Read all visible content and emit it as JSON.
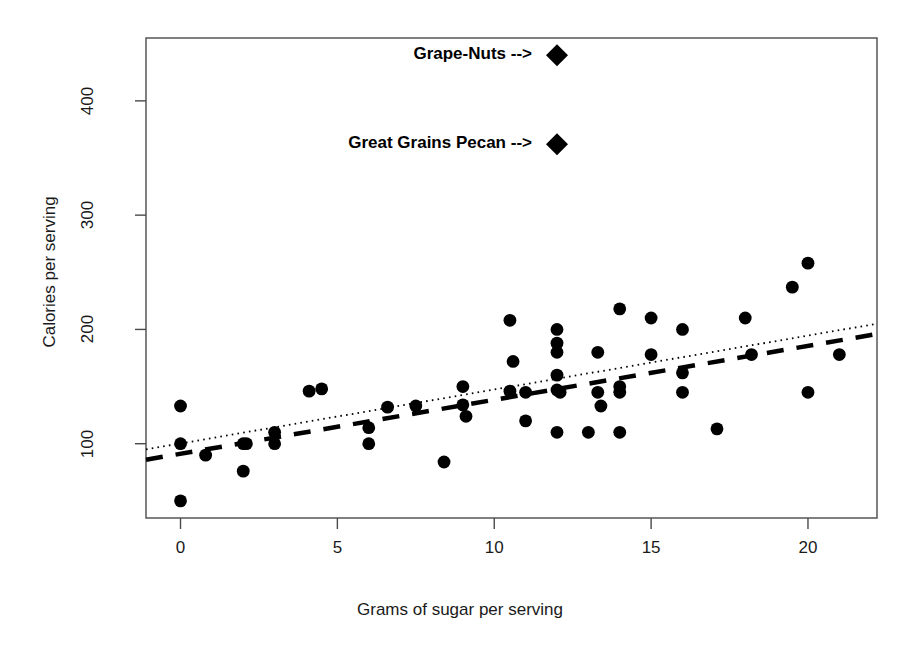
{
  "chart_data": {
    "type": "scatter",
    "title": "",
    "xlabel": "Grams of sugar per serving",
    "ylabel": "Calories per serving",
    "xlim": [
      -1.1,
      22.2
    ],
    "ylim": [
      35,
      455
    ],
    "xticks": [
      0,
      5,
      10,
      15,
      20
    ],
    "xtick_labels": [
      "0",
      "5",
      "10",
      "15",
      "20"
    ],
    "yticks": [
      100,
      200,
      300,
      400
    ],
    "ytick_labels": [
      "100",
      "200",
      "300",
      "400"
    ],
    "grid": false,
    "legend": "none",
    "marker": "filled-circle",
    "marker_color": "#000000",
    "points": [
      {
        "x": 0.0,
        "y": 133
      },
      {
        "x": 0.0,
        "y": 100
      },
      {
        "x": 0.0,
        "y": 50
      },
      {
        "x": 0.8,
        "y": 90
      },
      {
        "x": 2.0,
        "y": 100
      },
      {
        "x": 2.1,
        "y": 100
      },
      {
        "x": 2.0,
        "y": 76
      },
      {
        "x": 3.0,
        "y": 110
      },
      {
        "x": 3.0,
        "y": 100
      },
      {
        "x": 4.1,
        "y": 146
      },
      {
        "x": 4.5,
        "y": 148
      },
      {
        "x": 6.0,
        "y": 114
      },
      {
        "x": 6.0,
        "y": 100
      },
      {
        "x": 6.6,
        "y": 132
      },
      {
        "x": 7.5,
        "y": 133
      },
      {
        "x": 8.4,
        "y": 84
      },
      {
        "x": 9.0,
        "y": 150
      },
      {
        "x": 9.0,
        "y": 134
      },
      {
        "x": 9.1,
        "y": 124
      },
      {
        "x": 10.5,
        "y": 208
      },
      {
        "x": 10.6,
        "y": 172
      },
      {
        "x": 10.5,
        "y": 146
      },
      {
        "x": 11.0,
        "y": 145
      },
      {
        "x": 11.0,
        "y": 120
      },
      {
        "x": 12.0,
        "y": 200
      },
      {
        "x": 12.0,
        "y": 188
      },
      {
        "x": 12.0,
        "y": 180
      },
      {
        "x": 12.0,
        "y": 160
      },
      {
        "x": 12.0,
        "y": 147
      },
      {
        "x": 12.1,
        "y": 145
      },
      {
        "x": 12.0,
        "y": 110
      },
      {
        "x": 13.0,
        "y": 110
      },
      {
        "x": 13.3,
        "y": 180
      },
      {
        "x": 13.3,
        "y": 145
      },
      {
        "x": 13.4,
        "y": 133
      },
      {
        "x": 14.0,
        "y": 218
      },
      {
        "x": 14.0,
        "y": 150
      },
      {
        "x": 14.0,
        "y": 145
      },
      {
        "x": 14.0,
        "y": 110
      },
      {
        "x": 15.0,
        "y": 210
      },
      {
        "x": 15.0,
        "y": 178
      },
      {
        "x": 16.0,
        "y": 200
      },
      {
        "x": 16.0,
        "y": 162
      },
      {
        "x": 16.0,
        "y": 145
      },
      {
        "x": 17.1,
        "y": 113
      },
      {
        "x": 18.0,
        "y": 210
      },
      {
        "x": 18.2,
        "y": 178
      },
      {
        "x": 19.5,
        "y": 237
      },
      {
        "x": 20.0,
        "y": 258
      },
      {
        "x": 20.0,
        "y": 145
      },
      {
        "x": 21.0,
        "y": 178
      }
    ],
    "highlighted_points": [
      {
        "label": "Grape-Nuts",
        "x": 12.0,
        "y": 440,
        "marker": "filled-diamond"
      },
      {
        "label": "Great Grains Pecan",
        "x": 12.0,
        "y": 362,
        "marker": "filled-diamond"
      }
    ],
    "annotations": [
      {
        "text": "Grape-Nuts -->",
        "x": 12.0,
        "y": 440
      },
      {
        "text": "Great Grains Pecan -->",
        "x": 12.0,
        "y": 362
      }
    ],
    "lines": [
      {
        "name": "least-squares-fit-dashed",
        "style": "dashed",
        "x0": -1.1,
        "y0": 86,
        "x1": 22.2,
        "y1": 196
      },
      {
        "name": "robust-fit-dotted",
        "style": "dotted",
        "x0": -1.1,
        "y0": 95,
        "x1": 22.2,
        "y1": 205
      }
    ]
  }
}
